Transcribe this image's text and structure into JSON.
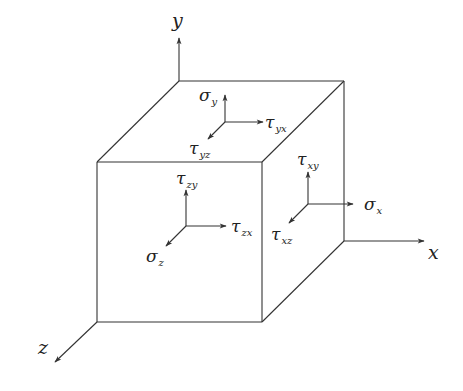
{
  "diagram": {
    "axes": [
      {
        "name": "y",
        "label": "y",
        "from": [
          179,
          81
        ],
        "to": [
          179,
          38
        ],
        "label_pos": [
          172,
          27
        ]
      },
      {
        "name": "x",
        "label": "x",
        "from": [
          344,
          241
        ],
        "to": [
          424,
          241
        ],
        "label_pos": [
          428,
          259
        ]
      },
      {
        "name": "z",
        "label": "z",
        "from": [
          97,
          322
        ],
        "to": [
          55,
          362
        ],
        "label_pos": [
          38,
          354
        ]
      }
    ],
    "cube": {
      "front_face": {
        "top_left": [
          97,
          162
        ],
        "top_right": [
          262,
          162
        ],
        "bottom_right": [
          262,
          322
        ],
        "bottom_left": [
          97,
          322
        ]
      },
      "back_top_left": [
        179,
        81
      ],
      "back_top_right": [
        344,
        81
      ],
      "back_bottom_right": [
        344,
        241
      ]
    },
    "faces": {
      "top": {
        "origin": [
          225,
          122
        ],
        "stresses": [
          {
            "symbol": "σ",
            "sub": "y",
            "direction": "up",
            "tip": [
              225,
              95
            ],
            "label_pos": [
              199,
              101
            ]
          },
          {
            "symbol": "τ",
            "sub": "yx",
            "direction": "right",
            "tip": [
              263,
              122
            ],
            "label_pos": [
              265,
              128
            ]
          },
          {
            "symbol": "τ",
            "sub": "yz",
            "direction": "down-left",
            "tip": [
              208,
              139
            ],
            "label_pos": [
              189,
              154
            ]
          }
        ]
      },
      "front": {
        "origin": [
          186,
          226
        ],
        "stresses": [
          {
            "symbol": "τ",
            "sub": "zy",
            "direction": "up",
            "tip": [
              186,
              190
            ],
            "label_pos": [
              176,
              184
            ]
          },
          {
            "symbol": "τ",
            "sub": "zx",
            "direction": "right",
            "tip": [
              226,
              226
            ],
            "label_pos": [
              231,
              232
            ]
          },
          {
            "symbol": "σ",
            "sub": "z",
            "direction": "down-left",
            "tip": [
              166,
              246
            ],
            "label_pos": [
              146,
              262
            ]
          }
        ]
      },
      "right": {
        "origin": [
          308,
          204
        ],
        "stresses": [
          {
            "symbol": "τ",
            "sub": "xy",
            "direction": "up",
            "tip": [
              308,
              172
            ],
            "label_pos": [
              297,
              165
            ]
          },
          {
            "symbol": "σ",
            "sub": "x",
            "direction": "right",
            "tip": [
              353,
              204
            ],
            "label_pos": [
              364,
              210
            ]
          },
          {
            "symbol": "τ",
            "sub": "xz",
            "direction": "down-left",
            "tip": [
              289,
              223
            ],
            "label_pos": [
              271,
              240
            ]
          }
        ]
      }
    },
    "colors": {
      "line": "#333333",
      "text": "#222222",
      "background": "#ffffff"
    }
  }
}
